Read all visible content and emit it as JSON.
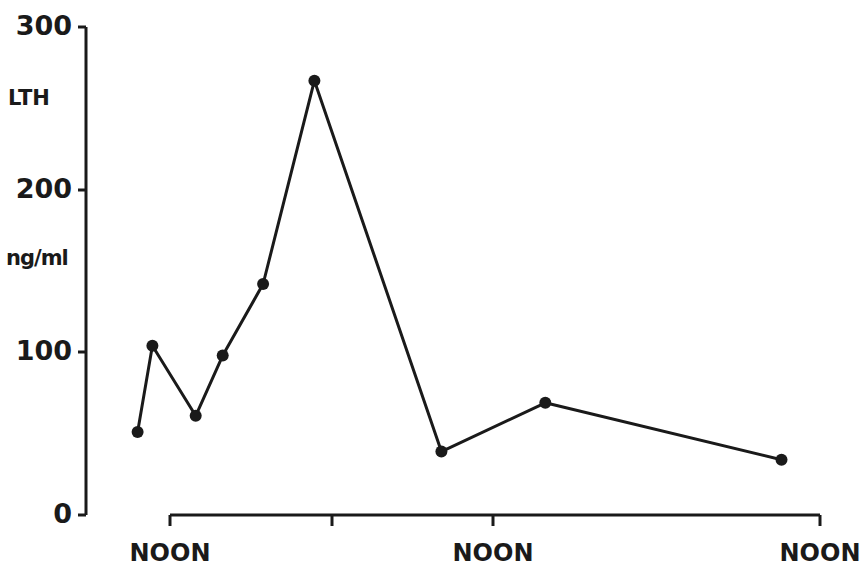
{
  "chart_data": {
    "type": "line",
    "title": "",
    "ylabel_top": "LTH",
    "ylabel_unit": "ng/ml",
    "xlabel": "",
    "ylim": [
      0,
      300
    ],
    "yticks": [
      0,
      100,
      200,
      300
    ],
    "ytick_labels": [
      "0",
      "100",
      "200",
      "300"
    ],
    "xticks_hours": [
      0,
      12,
      24,
      48
    ],
    "xtick_labels": [
      "NOON",
      "",
      "NOON",
      "NOON"
    ],
    "x_units": "hours relative to first noon (estimated)",
    "grid": false,
    "legend": null,
    "series": [
      {
        "name": "LTH",
        "marker": "filled-circle",
        "color": "#1a1a1a",
        "x": [
          -2.4,
          -1.3,
          1.9,
          3.9,
          6.9,
          10.7,
          20.1,
          27.8,
          45.3
        ],
        "values": [
          51,
          104,
          61,
          98,
          142,
          267,
          39,
          69,
          34
        ]
      }
    ]
  },
  "labels": {
    "y300": "300",
    "y200": "200",
    "y100": "100",
    "y0": "0",
    "lth": "LTH",
    "unit": "ng/ml",
    "noon1": "NOON",
    "noon2": "NOON",
    "noon3": "NOON"
  }
}
